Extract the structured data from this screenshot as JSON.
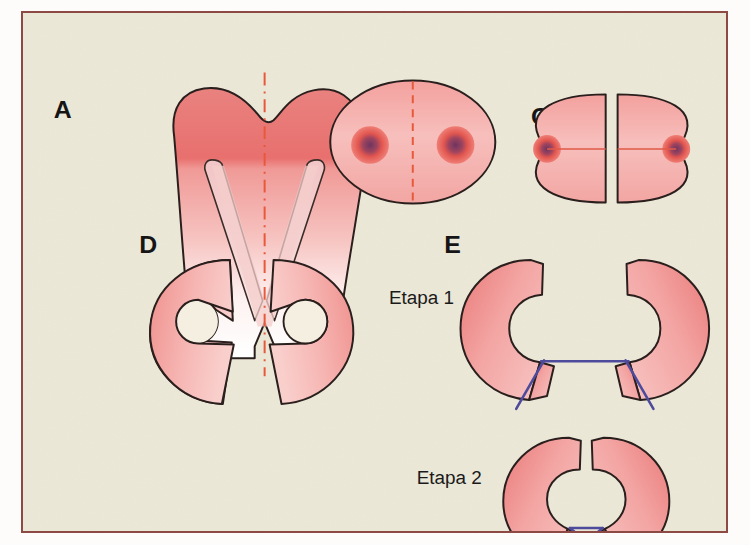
{
  "figure": {
    "background_color": "#ece8d8",
    "frame_color": "#8d4a44",
    "outline_color": "#2a1f1d",
    "tissue_color": "#f29b98",
    "tissue_color_deep": "#e8716f",
    "tissue_color_light": "#f8d3d0",
    "nucleus_color": "#7b3a6b",
    "axis_color": "#e8583a",
    "suture_color": "#4f4b9c"
  },
  "panels": [
    {
      "id": "panel-a",
      "letter": "A",
      "description": "Molar en corte longitudinal con linea de seccion vertical discontinua"
    },
    {
      "id": "panel-b",
      "letter": "B",
      "description": "Vista oclusal del molar con dos conductos y linea de seccion discontinua"
    },
    {
      "id": "panel-c",
      "letter": "C",
      "description": "Las dos mitades separadas tras la hemiseccion"
    },
    {
      "id": "panel-d",
      "letter": "D",
      "description": "Las dos mitades preparadas con muesca retentiva"
    },
    {
      "id": "panel-e",
      "letter": "E",
      "description": "Reposicion y sutura en dos etapas"
    }
  ],
  "stages": [
    {
      "id": "stage-1",
      "label": "Etapa 1"
    },
    {
      "id": "stage-2",
      "label": "Etapa 2"
    }
  ]
}
